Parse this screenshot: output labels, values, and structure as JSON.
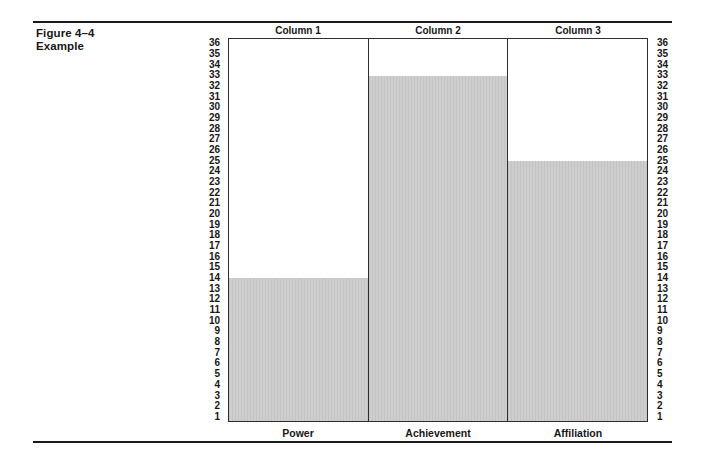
{
  "figure": {
    "title": "Figure 4–4",
    "subtitle": "Example"
  },
  "chart_data": {
    "type": "bar",
    "title": "Figure 4–4 Example",
    "column_headers": [
      "Column 1",
      "Column 2",
      "Column 3"
    ],
    "categories": [
      "Power",
      "Achievement",
      "Affiliation"
    ],
    "values": [
      14,
      33,
      25
    ],
    "xlabel": "",
    "ylabel": "",
    "ylim": [
      1,
      36
    ],
    "y_ticks": [
      36,
      35,
      34,
      33,
      32,
      31,
      30,
      29,
      28,
      27,
      26,
      25,
      24,
      23,
      22,
      21,
      20,
      19,
      18,
      17,
      16,
      15,
      14,
      13,
      12,
      11,
      10,
      9,
      8,
      7,
      6,
      5,
      4,
      3,
      2,
      1
    ],
    "y_axis_sides": "both",
    "grid": false,
    "legend_position": "none",
    "bar_color": "#cbcbcb",
    "border_color": "#2e2e2e"
  }
}
